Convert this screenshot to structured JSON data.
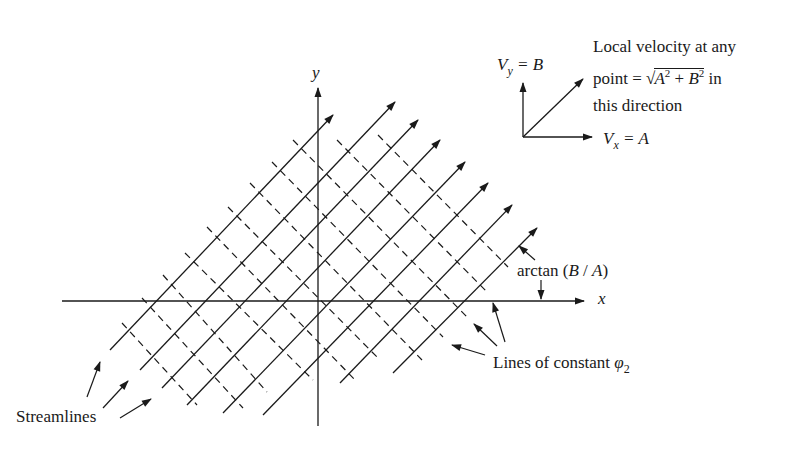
{
  "figure": {
    "type": "potential-flow-diagram"
  },
  "axes": {
    "x_label": "x",
    "y_label": "y"
  },
  "legend_vector": {
    "vy_label_main": "V",
    "vy_label_sub": "y",
    "vy_label_rhs": "= B",
    "vx_label_main": "V",
    "vx_label_sub": "x",
    "vx_label_rhs": "= A",
    "note_line1": "Local velocity at any",
    "note_line2_prefix": "point = ",
    "note_line2_sqrt_a": "A",
    "note_line2_sqrt_plus": " + ",
    "note_line2_sqrt_b": "B",
    "note_line2_exp": "2",
    "note_line2_suffix": " in",
    "note_line3": "this direction"
  },
  "annotations": {
    "angle_label": "arctan (B / A)",
    "angle_label_prefix": "arctan (",
    "angle_label_b": "B",
    "angle_label_slash": " / ",
    "angle_label_a": "A",
    "angle_label_suffix": ")",
    "potential_label_prefix": "Lines of constant ",
    "potential_label_symbol": "φ",
    "potential_label_sub": "2",
    "streamlines_label": "Streamlines"
  },
  "colors": {
    "ink": "#1a1a1a",
    "background": "#ffffff"
  },
  "geometry": {
    "streamlines": [
      [
        110,
        350,
        333,
        115
      ],
      [
        140,
        370,
        395,
        102
      ],
      [
        162,
        388,
        418,
        120
      ],
      [
        187,
        405,
        440,
        140
      ],
      [
        223,
        413,
        465,
        162
      ],
      [
        263,
        415,
        488,
        183
      ],
      [
        340,
        383,
        512,
        205
      ],
      [
        393,
        373,
        537,
        228
      ]
    ],
    "potential_lines": [
      [
        122,
        323,
        197,
        405
      ],
      [
        142,
        298,
        243,
        408
      ],
      [
        163,
        275,
        267,
        392
      ],
      [
        185,
        253,
        313,
        380
      ],
      [
        207,
        227,
        357,
        382
      ],
      [
        228,
        207,
        380,
        360
      ],
      [
        250,
        183,
        422,
        360
      ],
      [
        272,
        162,
        443,
        337
      ],
      [
        293,
        140,
        467,
        317
      ],
      [
        337,
        140,
        487,
        292
      ],
      [
        378,
        135,
        508,
        267
      ]
    ]
  }
}
